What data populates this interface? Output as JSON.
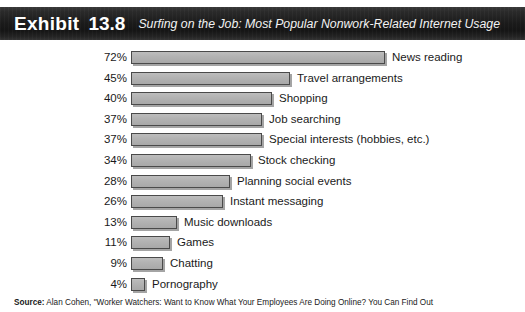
{
  "header": {
    "exhibit_label": "Exhibit",
    "exhibit_number": "13.8",
    "subtitle": "Surfing on the Job: Most Popular Nonwork-Related Internet Usage"
  },
  "source": {
    "label": "Source:",
    "text": " Alan Cohen, \"Worker Watchers: Want to Know What Your Employees Are Doing Online? You Can Find Out"
  },
  "chart_data": {
    "type": "bar",
    "orientation": "horizontal",
    "title": "Surfing on the Job: Most Popular Nonwork-Related Internet Usage",
    "xlabel": "",
    "ylabel": "",
    "xlim": [
      0,
      72
    ],
    "grid": false,
    "legend": "none",
    "value_suffix": "%",
    "categories": [
      "News reading",
      "Travel arrangements",
      "Shopping",
      "Job searching",
      "Special interests (hobbies, etc.)",
      "Stock checking",
      "Planning social events",
      "Instant messaging",
      "Music downloads",
      "Games",
      "Chatting",
      "Pornography"
    ],
    "values": [
      72,
      45,
      40,
      37,
      37,
      34,
      28,
      26,
      13,
      11,
      9,
      4
    ],
    "labels": [
      "72%",
      "45%",
      "40%",
      "37%",
      "37%",
      "34%",
      "28%",
      "26%",
      "13%",
      "11%",
      "9%",
      "4%"
    ],
    "bar_color": "#b3b3b3",
    "bar_border_color": "#4a4a4a"
  }
}
